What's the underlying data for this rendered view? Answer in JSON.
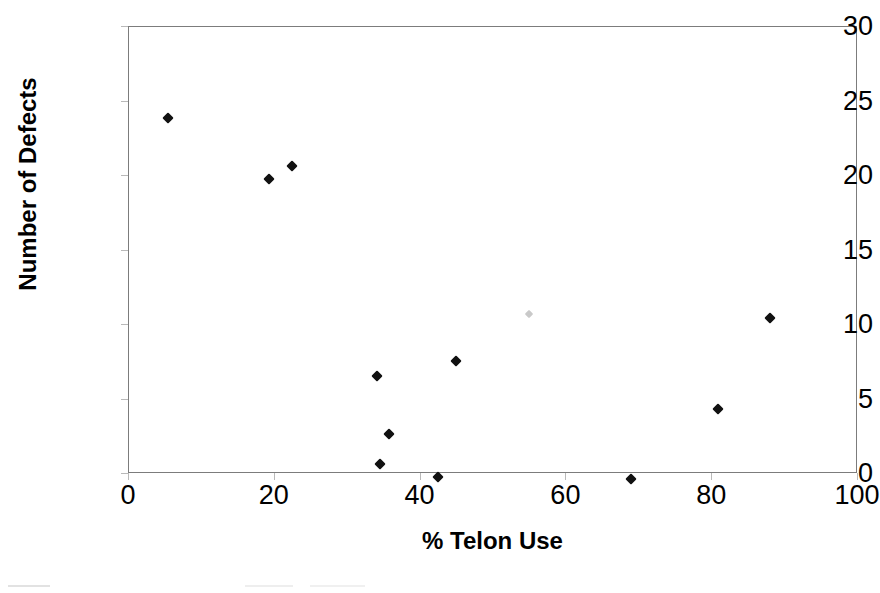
{
  "chart_data": {
    "type": "scatter",
    "title": "",
    "xlabel": "% Telon Use",
    "ylabel": "Number of Defects",
    "xlim": [
      0,
      100
    ],
    "ylim": [
      0,
      30
    ],
    "xticks": [
      0,
      20,
      40,
      60,
      80,
      100
    ],
    "yticks": [
      0,
      5,
      10,
      15,
      20,
      25,
      30
    ],
    "xtick_labels": [
      "0",
      "20",
      "40",
      "60",
      "80",
      "100"
    ],
    "ytick_labels": [
      "0",
      "5",
      "10",
      "15",
      "20",
      "25",
      "30"
    ],
    "grid": false,
    "legend": false,
    "marker": "diamond",
    "marker_color": "#111111",
    "frame_color": "#7c7c7c",
    "points": [
      {
        "x": 5.5,
        "y": 23.8,
        "faint": false
      },
      {
        "x": 19.3,
        "y": 19.7,
        "faint": false
      },
      {
        "x": 22.5,
        "y": 20.6,
        "faint": false
      },
      {
        "x": 34.2,
        "y": 6.5,
        "faint": false
      },
      {
        "x": 34.5,
        "y": 0.6,
        "faint": false
      },
      {
        "x": 35.8,
        "y": 2.6,
        "faint": false
      },
      {
        "x": 42.5,
        "y": -0.3,
        "faint": false
      },
      {
        "x": 45.0,
        "y": 7.5,
        "faint": false
      },
      {
        "x": 55.0,
        "y": 10.7,
        "faint": true
      },
      {
        "x": 69.0,
        "y": -0.4,
        "faint": false
      },
      {
        "x": 81.0,
        "y": 4.3,
        "faint": false
      },
      {
        "x": 88.0,
        "y": 10.4,
        "faint": false
      }
    ]
  }
}
